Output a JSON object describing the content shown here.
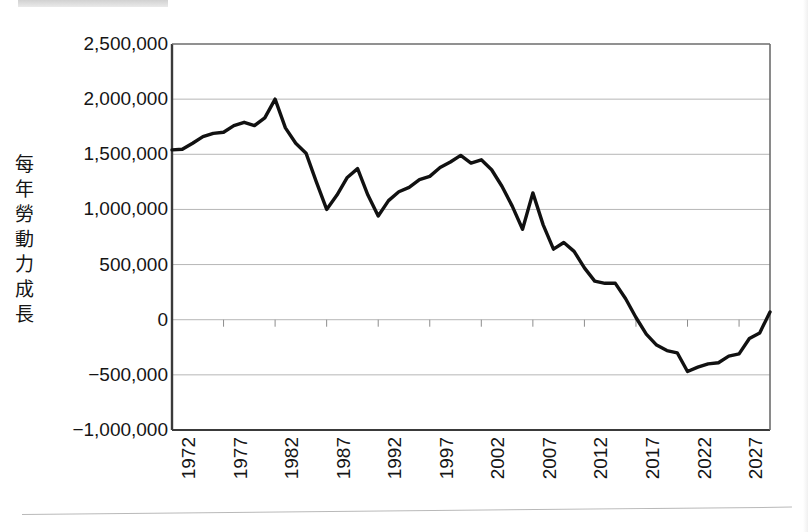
{
  "chart_data": {
    "type": "line",
    "title": "",
    "xlabel": "",
    "ylabel": "每年勞動力成長",
    "ylabel_chars": [
      "每",
      "年",
      "勞",
      "動",
      "力",
      "成",
      "長"
    ],
    "xlim": [
      1972,
      2030
    ],
    "ylim": [
      -1000000,
      2500000
    ],
    "grid": true,
    "legend": "none",
    "line_color": "#111111",
    "grid_color": "#b6b6b6",
    "axis_color": "#3a3a3a",
    "background_color": "#ffffff",
    "ytick_labels": [
      "2,500,000",
      "2,000,000",
      "1,500,000",
      "1,000,000",
      "500,000",
      "0",
      "−500,000",
      "−1,000,000"
    ],
    "ytick_values": [
      2500000,
      2000000,
      1500000,
      1000000,
      500000,
      0,
      -500000,
      -1000000
    ],
    "xtick_labels": [
      "1972",
      "1977",
      "1982",
      "1987",
      "1992",
      "1997",
      "2002",
      "2007",
      "2012",
      "2017",
      "2022",
      "2027"
    ],
    "xtick_values": [
      1972,
      1977,
      1982,
      1987,
      1992,
      1997,
      2002,
      2007,
      2012,
      2017,
      2022,
      2027
    ],
    "x": [
      1972,
      1973,
      1974,
      1975,
      1976,
      1977,
      1978,
      1979,
      1980,
      1981,
      1982,
      1983,
      1984,
      1985,
      1986,
      1987,
      1988,
      1989,
      1990,
      1991,
      1992,
      1993,
      1994,
      1995,
      1996,
      1997,
      1998,
      1999,
      2000,
      2001,
      2002,
      2003,
      2004,
      2005,
      2006,
      2007,
      2008,
      2009,
      2010,
      2011,
      2012,
      2013,
      2014,
      2015,
      2016,
      2017,
      2018,
      2019,
      2020,
      2021,
      2022,
      2023,
      2024,
      2025,
      2026,
      2027,
      2028,
      2029,
      2030
    ],
    "values": [
      1540000,
      1545000,
      1600000,
      1660000,
      1690000,
      1700000,
      1760000,
      1790000,
      1760000,
      1830000,
      2000000,
      1740000,
      1600000,
      1510000,
      1250000,
      1000000,
      1130000,
      1290000,
      1370000,
      1130000,
      940000,
      1080000,
      1160000,
      1200000,
      1270000,
      1300000,
      1380000,
      1430000,
      1490000,
      1420000,
      1450000,
      1360000,
      1210000,
      1030000,
      820000,
      1150000,
      860000,
      640000,
      700000,
      620000,
      470000,
      350000,
      330000,
      330000,
      190000,
      20000,
      -130000,
      -230000,
      -280000,
      -300000,
      -470000,
      -430000,
      -400000,
      -390000,
      -330000,
      -310000,
      -170000,
      -120000,
      70000
    ],
    "series_name": "每年勞動力成長"
  }
}
